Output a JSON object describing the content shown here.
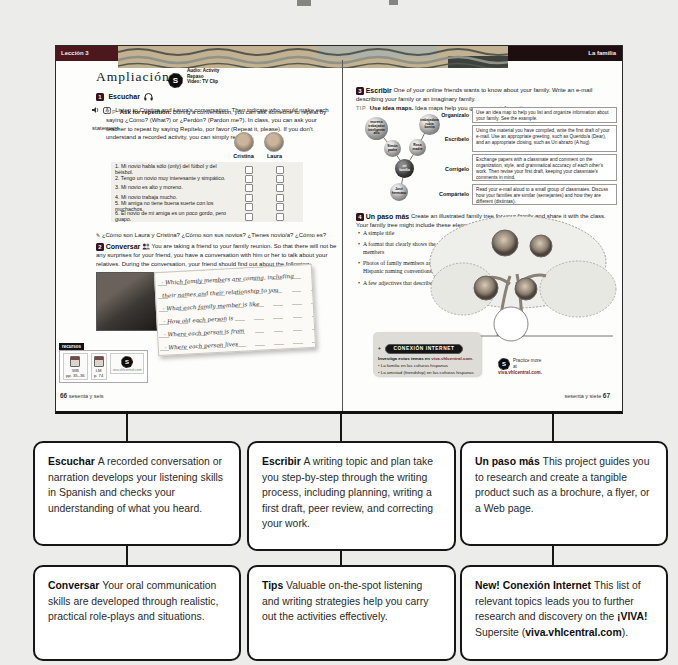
{
  "header": {
    "left_tab": "Lección 3",
    "right_tab": "La familia"
  },
  "left_page": {
    "title": "Ampliación",
    "supersite": {
      "icon": "S",
      "line1": "Audio: Activity",
      "line2": "Repaso",
      "line3": "Video: TV Clip"
    },
    "activity1": {
      "number": "1",
      "label": "Escuchar",
      "audio_badge": "A",
      "intro": "Listen to Cristina and Laura's conversation. Then indicate who would make each statement.",
      "tip_label": "TIP",
      "tip_lead": "Ask for repetition.",
      "tip_text": "During a conversation, you can ask someone to repeat by saying ¿Cómo? (What?) or ¿Perdón? (Pardon me?). In class, you can ask your teacher to repeat by saying Repítelo, por favor (Repeat it, please). If you don't understand a recorded activity, you can simply replay it.",
      "columns": [
        "Cristina",
        "Laura"
      ],
      "statements": [
        "1. Mi novio habla sólo (only) del fútbol y del béisbol.",
        "2. Tengo un novio muy interesante y simpático.",
        "3. Mi novio es alto y moreno.",
        "4. Mi novio trabaja mucho.",
        "5. Mi amiga no tiene buena suerte con los muchachos.",
        "6. El novio de mi amiga es un poco gordo, pero guapo."
      ]
    },
    "question": "¿Cómo son Laura y Cristina? ¿Cómo son sus novios? ¿Tienes novio/a? ¿Cómo es?",
    "activity2": {
      "number": "2",
      "label": "Conversar",
      "text": "You are taking a friend to your family reunion. So that there will not be any surprises for your friend, you have a conversation with him or her to talk about your relatives. During the conversation, your friend should find out about the following:",
      "notepad": [
        "· Which family members are coming, including their names and their relationship to you",
        "· What each family member is like",
        "· How old each person is",
        "· Where each person is from",
        "· Where each person lives"
      ]
    },
    "recursos": {
      "label": "recursos",
      "item1_top": "WB",
      "item1_bottom": "pp. 35–36",
      "item2_top": "LM",
      "item2_bottom": "p. 74",
      "item3": "viva.vhlcentral.com"
    },
    "footer_number": "66",
    "footer_text": "sesenta y seis"
  },
  "right_page": {
    "activity3": {
      "number": "3",
      "label": "Escribir",
      "text": "One of your online friends wants to know about your family. Write an e-mail describing your family or an imaginary family.",
      "tip_label": "TIP",
      "tip_lead": "Use idea maps.",
      "tip_text": "Idea maps help you group your information."
    },
    "idea_map": {
      "bubbles": [
        "moreno trabajador inteligente alto",
        "Simón padre",
        "trabajadora rubia bonita",
        "Rosa madre",
        "mi familia",
        "José hermano"
      ],
      "steps": [
        {
          "label": "Organízalo",
          "text": "Use an idea map to help you list and organize information about your family. See the example."
        },
        {
          "label": "Escríbelo",
          "text": "Using the material you have compiled, write the first draft of your e-mail. Use an appropriate greeting, such as Querido/a (Dear), and an appropriate closing, such as Un abrazo (A hug)."
        },
        {
          "label": "Corrígelo",
          "text": "Exchange papers with a classmate and comment on the organization, style, and grammatical accuracy of each other's work. Then revise your first draft, keeping your classmate's comments in mind."
        },
        {
          "label": "Compártelo",
          "text": "Read your e-mail aloud to a small group of classmates. Discuss how your families are similar (semejantes) and how they are different (distintas)."
        }
      ]
    },
    "activity4": {
      "number": "4",
      "label": "Un paso más",
      "text": "Create an illustrated family tree for your family and share it with the class. Your family tree might include these elements:",
      "bullets": [
        "A simple title",
        "A format that clearly shows the relationships between family members",
        "Photos of family members and their names, following Hispanic naming conventions",
        "A few adjectives that describe each family member"
      ]
    },
    "conexion": {
      "title": "CONEXIÓN INTERNET",
      "intro_lead": "Investiga estos temas en",
      "intro_url": "viva.vhlcentral.com.",
      "topics": [
        "• La familia en las culturas hispanas",
        "• La amistad (friendship) en las culturas hispanas"
      ]
    },
    "practice": {
      "line1": "Practice more at",
      "line2": "viva.vhlcentral.com."
    },
    "footer_text": "sesenta y siete",
    "footer_number": "67"
  },
  "callouts": [
    {
      "title": "Escuchar",
      "text": "A recorded conversation or narration develops your listening skills in Spanish and checks your understanding of what you heard."
    },
    {
      "title": "Escribir",
      "text": "A writing topic and plan take you step-by-step through the writing process, including planning, writing a first draft, peer review, and correcting your work."
    },
    {
      "title": "Un paso más",
      "text": "This project guides you to research and create a tangible product such as a brochure, a flyer, or a Web page."
    },
    {
      "title": "Conversar",
      "text": "Your oral communication skills are developed through realistic, practical role-plays and situations."
    },
    {
      "title": "Tips",
      "text": "Valuable on-the-spot listening and writing strategies help you carry out the activities effectively."
    },
    {
      "title": "New! Conexión Internet",
      "text_pre": "This list of relevant topics leads you to further research and discovery on the ",
      "bold1": "¡VIVA!",
      "text_mid": " Supersite (",
      "bold2": "viva.vhlcentral.com",
      "text_post": ")."
    }
  ],
  "colors": {
    "accent_maroon": "#4c181d",
    "header_bar": "#1f0e10",
    "banner_tan": "#c2b292"
  }
}
